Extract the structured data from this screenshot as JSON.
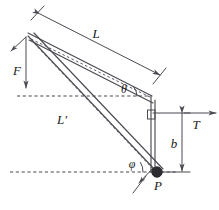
{
  "figure": {
    "type": "engineering-free-body-diagram",
    "title": "",
    "background_color": "#ffffff",
    "line_color": "#4a4a52",
    "label_color": "#1a1a1a",
    "width": 219,
    "height": 210
  },
  "labels": {
    "length_upper": "L",
    "length_lower": "L′",
    "force_f": "F",
    "force_t": "T",
    "distance_b": "b",
    "angle_theta": "θ",
    "angle_phi": "φ",
    "point_p": "P"
  },
  "geometry": {
    "apex": {
      "x": 28,
      "y": 33
    },
    "beam_end": {
      "x": 152,
      "y": 96
    },
    "point_p": {
      "x": 157,
      "y": 172
    },
    "post_top": {
      "x": 152,
      "y": 96
    },
    "post_bottom": {
      "x": 152,
      "y": 172
    },
    "dashed_line_upper_y": 96,
    "dashed_line_lower_y": 172,
    "dimension_b_x": 182,
    "tension_arrow_y": 112
  },
  "elements": [
    {
      "name": "upper-beam",
      "kind": "solid-line",
      "label": "L"
    },
    {
      "name": "lower-member",
      "kind": "solid-line",
      "label": "L′"
    },
    {
      "name": "dashed-chord-upper",
      "kind": "dashed-line"
    },
    {
      "name": "dashed-chord-lower",
      "kind": "dashed-line"
    },
    {
      "name": "vertical-post",
      "kind": "solid-line"
    },
    {
      "name": "horizontal-reference-upper",
      "kind": "dashed-line"
    },
    {
      "name": "horizontal-reference-lower",
      "kind": "dashed-line"
    },
    {
      "name": "dimension-L",
      "kind": "dimension-with-arrows",
      "label": "L"
    },
    {
      "name": "dimension-b",
      "kind": "dimension-with-arrows",
      "label": "b"
    },
    {
      "name": "force-F-arrow",
      "kind": "vector-arrow",
      "label": "F"
    },
    {
      "name": "force-T-arrow",
      "kind": "vector-arrow",
      "label": "T"
    },
    {
      "name": "angle-theta-arc",
      "kind": "angle-arc",
      "label": "θ"
    },
    {
      "name": "angle-phi-arc",
      "kind": "angle-arc",
      "label": "φ"
    },
    {
      "name": "right-angle-marker",
      "kind": "square-marker"
    },
    {
      "name": "pivot-point-P",
      "kind": "filled-circle",
      "label": "P"
    }
  ]
}
